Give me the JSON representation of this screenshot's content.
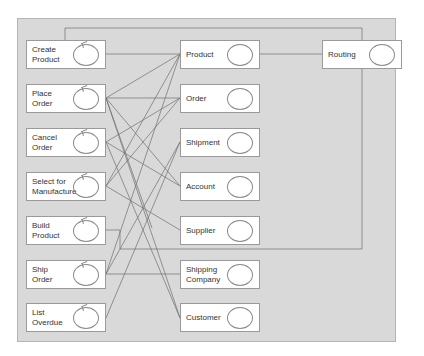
{
  "diagram": {
    "control_objects": [
      {
        "id": "create-product",
        "label": "Create\nProduct",
        "top": 40
      },
      {
        "id": "place-order",
        "label": "Place\nOrder",
        "top": 84
      },
      {
        "id": "cancel-order",
        "label": "Cancel\nOrder",
        "top": 128
      },
      {
        "id": "select-for-manufacture",
        "label": "Select for\nManufacture",
        "top": 172
      },
      {
        "id": "build-product",
        "label": "Build\nProduct",
        "top": 216
      },
      {
        "id": "ship-order",
        "label": "Ship\nOrder",
        "top": 260
      },
      {
        "id": "list-overdue",
        "label": "List\nOverdue",
        "top": 303
      }
    ],
    "entity_objects": [
      {
        "id": "product",
        "label": "Product",
        "top": 40
      },
      {
        "id": "order",
        "label": "Order",
        "top": 84
      },
      {
        "id": "shipment",
        "label": "Shipment",
        "top": 128
      },
      {
        "id": "account",
        "label": "Account",
        "top": 172
      },
      {
        "id": "supplier",
        "label": "Supplier",
        "top": 216
      },
      {
        "id": "shipping-company",
        "label": "Shipping\nCompany",
        "top": 260
      },
      {
        "id": "customer",
        "label": "Customer",
        "top": 303
      }
    ],
    "extra_objects": [
      {
        "id": "routing",
        "label": "Routing",
        "top": 40
      }
    ],
    "connections": [
      [
        "create-product",
        "product"
      ],
      [
        "place-order",
        "product"
      ],
      [
        "place-order",
        "order"
      ],
      [
        "place-order",
        "account"
      ],
      [
        "place-order",
        "supplier"
      ],
      [
        "place-order",
        "customer"
      ],
      [
        "cancel-order",
        "order"
      ],
      [
        "cancel-order",
        "account"
      ],
      [
        "cancel-order",
        "customer"
      ],
      [
        "select-for-manufacture",
        "product"
      ],
      [
        "select-for-manufacture",
        "order"
      ],
      [
        "select-for-manufacture",
        "supplier"
      ],
      [
        "ship-order",
        "product"
      ],
      [
        "ship-order",
        "shipment"
      ],
      [
        "ship-order",
        "shipping-company"
      ],
      [
        "list-overdue",
        "shipment"
      ],
      [
        "product",
        "routing"
      ],
      [
        "create-product",
        "routing"
      ],
      [
        "build-product",
        "routing"
      ]
    ],
    "colors": {
      "panel": "#d9d9d9",
      "box": "#ffffff",
      "line": "#6e6e6e"
    }
  }
}
